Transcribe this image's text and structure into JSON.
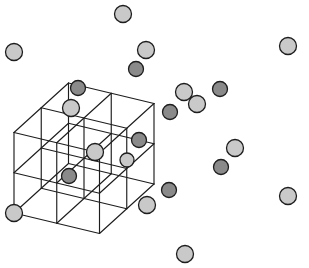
{
  "figure": {
    "type": "crystal-lattice-diagram",
    "projection": "oblique",
    "width": 309,
    "height": 268,
    "background_color": "#ffffff"
  },
  "style": {
    "edge_color": "#1d1d1d",
    "edge_width": 1.15,
    "atom_outline_color": "#1d1d1d",
    "atom_outline_width": 1.3,
    "light_atom_color": "#c9c9c9",
    "dark_atom_color": "#8a8a8a",
    "light_atom_radius": 8.5,
    "dark_atom_radius": 7.5
  },
  "geometry": {
    "description": "2x2x2 grid of cubes drawn in oblique projection. Grid origin is the front-bottom-left vertex; the x axis runs right-and-slightly-down, the y axis runs back-up-right, the z axis runs straight up.",
    "divisions": 2,
    "origin": {
      "x": 14,
      "y": 213
    },
    "axis_x": {
      "dx": 85.5,
      "dy": 20.5
    },
    "axis_y": {
      "dx": 54.5,
      "dy": -49.5
    },
    "axis_z": {
      "dx": 0,
      "dy": -80.5
    }
  },
  "atoms": {
    "light": [
      {
        "name": "vertex-top-back",
        "cx": 123,
        "cy": 14,
        "r": 8.5
      },
      {
        "name": "vertex-top-front-left",
        "cx": 14,
        "cy": 52,
        "r": 8.5
      },
      {
        "name": "vertex-top-front-right",
        "cx": 288,
        "cy": 46,
        "r": 8.5
      },
      {
        "name": "vertex-top-center",
        "cx": 146,
        "cy": 50,
        "r": 8.5
      },
      {
        "name": "node-upper-mid-right-a",
        "cx": 184,
        "cy": 92,
        "r": 8.5
      },
      {
        "name": "node-upper-mid-right-b",
        "cx": 197,
        "cy": 104,
        "r": 8.5
      },
      {
        "name": "node-mid-left-upper",
        "cx": 71,
        "cy": 108,
        "r": 8.5
      },
      {
        "name": "node-mid-left-lower",
        "cx": 95,
        "cy": 152,
        "r": 8.5
      },
      {
        "name": "node-mid-right",
        "cx": 235,
        "cy": 148,
        "r": 8.5
      },
      {
        "name": "node-center-dark-ringed",
        "cx": 127,
        "cy": 160,
        "r": 7.0
      },
      {
        "name": "vertex-bottom-front-left",
        "cx": 14,
        "cy": 213,
        "r": 8.5
      },
      {
        "name": "vertex-bottom-center",
        "cx": 147,
        "cy": 205,
        "r": 8.5
      },
      {
        "name": "vertex-bottom-right",
        "cx": 288,
        "cy": 196,
        "r": 8.5
      },
      {
        "name": "vertex-bottom-front",
        "cx": 185,
        "cy": 254,
        "r": 8.5
      }
    ],
    "dark": [
      {
        "name": "interstitial-top-center",
        "cx": 136,
        "cy": 69,
        "r": 7.5
      },
      {
        "name": "interstitial-upper-left",
        "cx": 78,
        "cy": 88,
        "r": 7.5
      },
      {
        "name": "interstitial-upper-right",
        "cx": 220,
        "cy": 89,
        "r": 7.5
      },
      {
        "name": "interstitial-center-upper",
        "cx": 170,
        "cy": 112,
        "r": 7.5
      },
      {
        "name": "interstitial-center",
        "cx": 139,
        "cy": 140,
        "r": 7.5
      },
      {
        "name": "interstitial-lower-left",
        "cx": 69,
        "cy": 176,
        "r": 7.5
      },
      {
        "name": "interstitial-lower-right",
        "cx": 221,
        "cy": 167,
        "r": 7.5
      },
      {
        "name": "interstitial-bottom",
        "cx": 169,
        "cy": 190,
        "r": 7.5
      }
    ]
  }
}
